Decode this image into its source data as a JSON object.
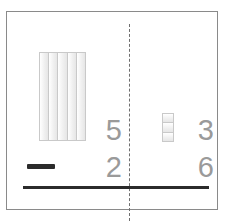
{
  "worksheet": {
    "name": "base-ten-subtraction-worksheet",
    "operation": "subtraction",
    "operator_symbol": "−",
    "columns": [
      "tens",
      "ones"
    ],
    "minuend": {
      "tens_digit": "5",
      "ones_digit": "3",
      "value": "53"
    },
    "subtrahend": {
      "tens_digit": "2",
      "ones_digit": "6",
      "value": "26"
    },
    "manipulatives": {
      "tens_rod": {
        "label": "tens-rod",
        "strip_count": 5
      },
      "unit_cubes": {
        "label": "unit-cubes",
        "cube_count": 3
      }
    },
    "colors": {
      "frame_border": "#8a8a8a",
      "divider": "#6f6f6f",
      "digit": "#9a9a9a",
      "rule": "#2b2b2b",
      "block_fill": "#f2f2f2",
      "block_border": "#c9c9c9",
      "background": "#ffffff"
    }
  }
}
